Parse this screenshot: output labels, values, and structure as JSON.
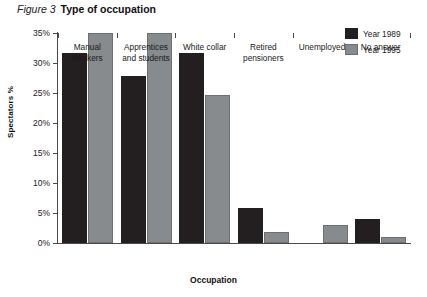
{
  "figure": {
    "number_label": "Figure 3",
    "title": "Type of occupation"
  },
  "chart_data": {
    "type": "bar",
    "title": "Type of occupation",
    "xlabel": "Occupation",
    "ylabel": "Spectators %",
    "ylim": [
      0,
      35
    ],
    "ytick_values": [
      0,
      5,
      10,
      15,
      20,
      25,
      30,
      35
    ],
    "ytick_labels": [
      "0%",
      "5%",
      "10%",
      "15%",
      "20%",
      "25%",
      "30%",
      "35%"
    ],
    "grid": false,
    "legend_position": "top-right",
    "categories": [
      "Manual Workers",
      "Apprentices and students",
      "White collar",
      "Retired pensioners",
      "Unemployed",
      "No answer"
    ],
    "category_lines": [
      [
        "Manual",
        "Workers"
      ],
      [
        "Apprentices",
        "and students"
      ],
      [
        "White collar"
      ],
      [
        "Retired",
        "pensioners"
      ],
      [
        "Unemployed"
      ],
      [
        "No answer"
      ]
    ],
    "series": [
      {
        "name": "Year 1989",
        "color": "#231f20",
        "values": [
          31.7,
          27.8,
          31.7,
          5.8,
          0,
          4.0
        ]
      },
      {
        "name": "Year 1995",
        "color": "#888b8d",
        "values": [
          35.0,
          35.0,
          24.7,
          1.8,
          3.0,
          1.0
        ]
      }
    ]
  },
  "legend": {
    "items": [
      {
        "label": "Year 1989",
        "series": "s1"
      },
      {
        "label": "Year 1995",
        "series": "s2"
      }
    ]
  }
}
